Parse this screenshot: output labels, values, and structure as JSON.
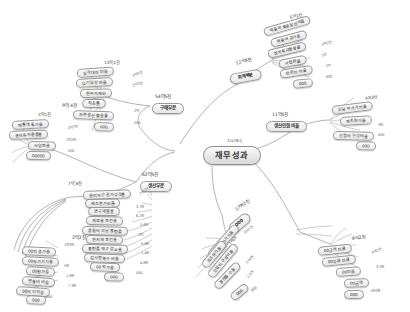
{
  "diagram": {
    "title": "재무성과",
    "root": {
      "label": "재무성과",
      "value": "324억6십"
    },
    "colors": {
      "line": "#9a9a9a",
      "node_border": "#9b9b9b",
      "text": "#2b2b2b",
      "background": "#ffffff"
    },
    "branches": [
      {
        "id": "purchasing",
        "label": "구매부문",
        "value": "54억5천",
        "nodes": [
          {
            "label": "실적대비 비율",
            "value": "13억3천"
          },
          {
            "label": "납기일정 비율",
            "value": "4억3천"
          },
          {
            "label": "원부자재비",
            "value": "2억7천"
          },
          {
            "label": "직송률",
            "value": ""
          },
          {
            "label": "자주생산 활용률",
            "value": "2억"
          },
          {
            "label": "000",
            "value": "000"
          }
        ]
      },
      {
        "id": "sales",
        "label": "매출부문",
        "value": "9억 4천",
        "nodes": [
          {
            "label": "매출액 증가율",
            "value": "3억1천"
          },
          {
            "label": "설비투자활용률",
            "value": "2억7천"
          },
          {
            "label": "사업화율",
            "value": "1억2천"
          },
          {
            "label": "00000",
            "value": "000"
          }
        ]
      },
      {
        "id": "accounting",
        "label": "회계부문",
        "value": "12억4천",
        "nodes": [
          {
            "label": "매출액 목표달성비율",
            "value": "6억1천"
          },
          {
            "label": "매출액 증가율",
            "value": ""
          },
          {
            "label": "설비투자활용률",
            "value": "4억2천"
          },
          {
            "label": "사업화율",
            "value": "3천"
          },
          {
            "label": "판관비 비율",
            "value": "1억"
          },
          {
            "label": "000",
            "value": "000"
          }
        ]
      },
      {
        "id": "hr",
        "label": "생산인원 비율",
        "value": "11억5천",
        "nodes": [
          {
            "label": "인당 부가가치율",
            "value": "4억3천"
          },
          {
            "label": "구매단가",
            "value": ""
          },
          {
            "label": "제조원가율",
            "value": ""
          },
          {
            "label": "간접비 구성비율",
            "value": "3천"
          },
          {
            "label": "000",
            "value": "000"
          }
        ]
      },
      {
        "id": "production",
        "label": "생산부문",
        "value": "62억5천",
        "nodes": [
          {
            "label": "설비자산 감가상각률",
            "value": "7억 8천"
          },
          {
            "label": "재조원가비율",
            "value": "2억2천"
          },
          {
            "label": "연구개발율",
            "value": "3.7천"
          },
          {
            "label": "재료율 회전율",
            "value": "6.2천"
          },
          {
            "label": "품질비 외날 불량률",
            "value": "5.6천"
          },
          {
            "label": "원자재 회전율",
            "value": "2억"
          },
          {
            "label": "불량률 재고 감소율",
            "value": "9.8천"
          },
          {
            "label": "검사항목수 비율",
            "value": "1.4천"
          },
          {
            "label": "00 부가율",
            "value": "4.8천"
          },
          {
            "label": "000",
            "value": "000"
          }
        ]
      },
      {
        "id": "cost",
        "label": "원가부문",
        "value": "2억2천",
        "nodes": [
          {
            "label": "00억 증가율",
            "value": "1억3천"
          },
          {
            "label": "00부가가치율",
            "value": ""
          },
          {
            "label": "00원가율",
            "value": "5천"
          },
          {
            "label": "변동비 비율",
            "value": "1.9천"
          },
          {
            "label": "00비 이익율",
            "value": "7.3천"
          },
          {
            "label": "000",
            "value": "000"
          }
        ]
      },
      {
        "id": "quality",
        "label": "000",
        "value": "17억2천",
        "nodes": [
          {
            "label": "인당 부가가치율",
            "value": "6억5천"
          },
          {
            "label": "제조원가율",
            "value": "3억6천"
          },
          {
            "label": "간접비 구성비율",
            "value": "1억2천"
          },
          {
            "label": "불량률 수율",
            "value": "1.9천"
          },
          {
            "label": "000",
            "value": "000"
          }
        ]
      },
      {
        "id": "etc",
        "label": "000부문",
        "value": "9억2천",
        "nodes": [
          {
            "label": "00금액 비율",
            "value": ""
          },
          {
            "label": "00인원 비율",
            "value": "4억2천"
          },
          {
            "label": "00비율",
            "value": "3.5천"
          },
          {
            "label": "00금액",
            "value": ""
          },
          {
            "label": "000",
            "value": "1천5백"
          }
        ]
      }
    ]
  }
}
